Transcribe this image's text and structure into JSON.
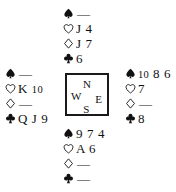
{
  "diagram": {
    "kind": "bridge-hand-diagram",
    "background_color": "#ffffff",
    "ink_color": "#111111"
  },
  "suits": {
    "spade": {
      "name": "spade-icon",
      "glyph": "♠",
      "filled": true,
      "label": "Spades"
    },
    "heart": {
      "name": "heart-icon",
      "glyph": "♡",
      "filled": false,
      "label": "Hearts"
    },
    "diamond": {
      "name": "diamond-icon",
      "glyph": "♢",
      "filled": false,
      "label": "Diamonds"
    },
    "club": {
      "name": "club-icon",
      "glyph": "♣",
      "filled": true,
      "label": "Clubs"
    }
  },
  "void_mark": "—",
  "compass": {
    "north": "N",
    "west": "W",
    "east": "E",
    "south": "S"
  },
  "hands": {
    "north": {
      "position": "North",
      "spades": "—",
      "hearts": "J 4",
      "diamonds": "J 7",
      "clubs": "6"
    },
    "west": {
      "position": "West",
      "spades": "—",
      "hearts": "K 10",
      "diamonds": "—",
      "clubs": "Q J 9"
    },
    "east": {
      "position": "East",
      "spades": "10 8 6",
      "hearts": "7",
      "diamonds": "—",
      "clubs": "8"
    },
    "south": {
      "position": "South",
      "spades": "9 7 4",
      "hearts": "A 6",
      "diamonds": "—",
      "clubs": "—"
    }
  }
}
